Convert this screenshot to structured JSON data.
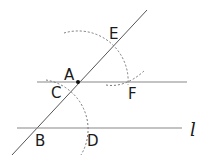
{
  "diagram": {
    "colors": {
      "line": "#555555",
      "arc": "#777777",
      "text": "#1a1a1a"
    },
    "labels": {
      "A": "A",
      "B": "B",
      "C": "C",
      "D": "D",
      "E": "E",
      "F": "F",
      "l": "l"
    },
    "points": {
      "A": [
        78,
        82
      ],
      "B": [
        36,
        128
      ],
      "C": [
        66,
        92
      ],
      "D": [
        85,
        128
      ],
      "E": [
        114,
        45
      ],
      "F": [
        128,
        82
      ]
    }
  }
}
